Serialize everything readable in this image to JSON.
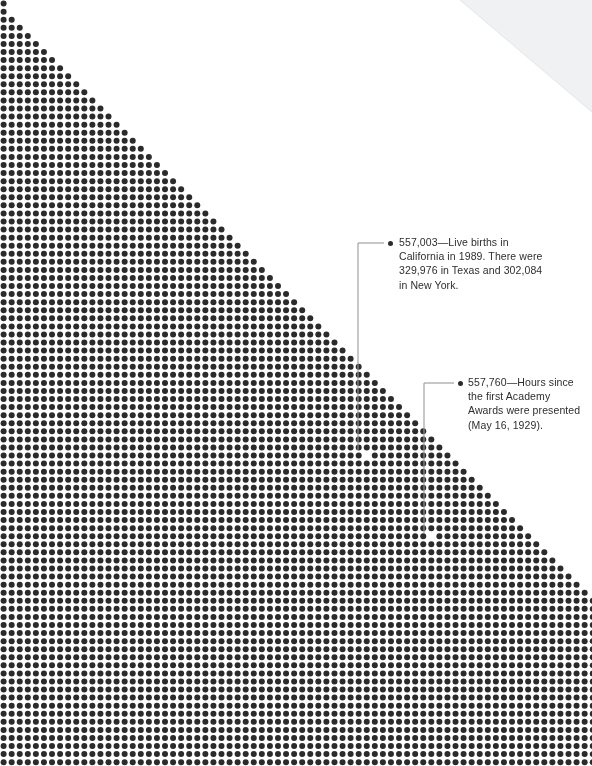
{
  "page": {
    "width": 592,
    "height": 766,
    "background_color": "#ffffff"
  },
  "dot_field": {
    "dot_color": "#2b2b2b",
    "dot_diameter": 6.0,
    "spacing_x": 8.07,
    "spacing_y": 8.07,
    "origin_x": 3.6,
    "origin_y": 3.6,
    "columns": 74,
    "rows": 95,
    "edge_description": "Diagonal edge descending to the right at approximately one column per row; region above-right of the diagonal is empty white.",
    "edge_start_column": 0,
    "edge_start_row": 0,
    "edge_slope_columns_per_row": 0.99,
    "highlighted_dots": [
      {
        "label": "target-births",
        "x": 365,
        "y": 453
      },
      {
        "label": "target-academy-awards",
        "x": 428,
        "y": 535
      }
    ]
  },
  "annotations": [
    {
      "id": "births",
      "value": "557,003",
      "separator": "—",
      "text": "557,003—Live births in California in 1989. There were 329,976 in Texas and 302,084 in New York.",
      "bullet_x": 388,
      "bullet_y": 241,
      "text_x": 399,
      "text_y": 235,
      "text_width": 150,
      "leader": {
        "color": "#9a9a9a",
        "from_x": 384,
        "from_y": 243,
        "corner_x": 358,
        "corner_y": 243,
        "to_x": 358,
        "to_y": 450
      }
    },
    {
      "id": "academy-awards",
      "value": "557,760",
      "separator": "—",
      "text": "557,760—Hours since the first Academy Awards were presented (May 16, 1929).",
      "bullet_x": 458,
      "bullet_y": 381,
      "text_x": 468,
      "text_y": 375,
      "text_width": 120,
      "leader": {
        "color": "#9a9a9a",
        "from_x": 454,
        "from_y": 383,
        "corner_x": 424,
        "corner_y": 383,
        "to_x": 424,
        "to_y": 533
      }
    }
  ],
  "page_curl": {
    "fill_color": "#f0f1f3",
    "edge_color": "#e3e5e8"
  }
}
